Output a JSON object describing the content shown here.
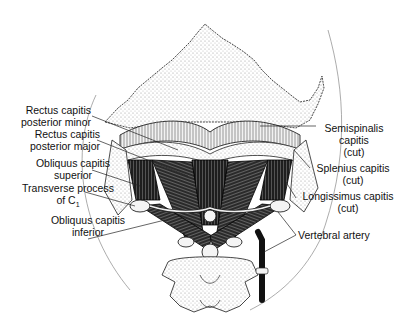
{
  "figure": {
    "labels_left": [
      {
        "id": "rectus-capitis-posterior-minor",
        "lines": [
          "Rectus capitis",
          "posterior minor"
        ]
      },
      {
        "id": "rectus-capitis-posterior-major",
        "lines": [
          "Rectus capitis",
          "posterior major"
        ]
      },
      {
        "id": "obliquus-capitis-superior",
        "lines": [
          "Obliquus capitis",
          "superior"
        ]
      },
      {
        "id": "transverse-process-c1",
        "lines": [
          "Transverse process",
          "of C",
          "1"
        ]
      },
      {
        "id": "obliquus-capitis-inferior",
        "lines": [
          "Obliquus capitis",
          "inferior"
        ]
      }
    ],
    "labels_right": [
      {
        "id": "semispinalis-capitis",
        "lines": [
          "Semispinalis",
          "capitis",
          "(cut)"
        ]
      },
      {
        "id": "splenius-capitis",
        "lines": [
          "Splenius capitis",
          "(cut)"
        ]
      },
      {
        "id": "longissimus-capitis",
        "lines": [
          "Longissimus capitis",
          "(cut)"
        ]
      },
      {
        "id": "vertebral-artery",
        "lines": [
          "Vertebral artery"
        ]
      }
    ],
    "colors": {
      "ink": "#111111",
      "stipple": "#bdbdbd",
      "muscle": "#1a1a1a",
      "background": "#ffffff"
    }
  }
}
